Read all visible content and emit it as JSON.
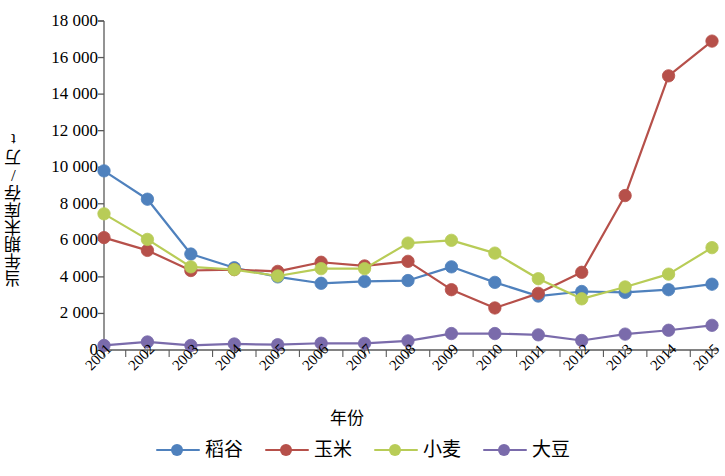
{
  "chart_data": {
    "type": "line",
    "title": "",
    "xlabel": "年份",
    "ylabel": "当年期末库存/万t",
    "categories": [
      "2001",
      "2002",
      "2003",
      "2004",
      "2005",
      "2006",
      "2007",
      "2008",
      "2009",
      "2010",
      "2011",
      "2012",
      "2013",
      "2014",
      "2015"
    ],
    "ylim": [
      0,
      18000
    ],
    "ytick_values": [
      0,
      2000,
      4000,
      6000,
      8000,
      10000,
      12000,
      14000,
      16000,
      18000
    ],
    "ytick_labels": [
      "0",
      "2 000",
      "4 000",
      "6 000",
      "8 000",
      "10 000",
      "12 000",
      "14 000",
      "16 000",
      "18 000"
    ],
    "grid": false,
    "legend_position": "bottom",
    "series": [
      {
        "name": "稻谷",
        "color": "#4f81bd",
        "values": [
          9800,
          8250,
          5250,
          4500,
          4000,
          3650,
          3750,
          3800,
          4550,
          3700,
          2950,
          3200,
          3150,
          3300,
          3600
        ]
      },
      {
        "name": "玉米",
        "color": "#b6504a",
        "values": [
          6150,
          5450,
          4350,
          4400,
          4300,
          4800,
          4600,
          4850,
          3300,
          2300,
          3100,
          4250,
          8450,
          15000,
          16900
        ]
      },
      {
        "name": "小麦",
        "color": "#b8cc57",
        "values": [
          7450,
          6050,
          4550,
          4400,
          4050,
          4450,
          4450,
          5850,
          6000,
          5300,
          3900,
          2800,
          3450,
          4150,
          5600
        ]
      },
      {
        "name": "大豆",
        "color": "#7a6bab",
        "values": [
          250,
          440,
          250,
          330,
          290,
          370,
          360,
          500,
          900,
          900,
          830,
          520,
          870,
          1080,
          1350
        ]
      }
    ]
  },
  "axes": {
    "x_title": "年份",
    "y_title": "当年期末库存/万t"
  }
}
